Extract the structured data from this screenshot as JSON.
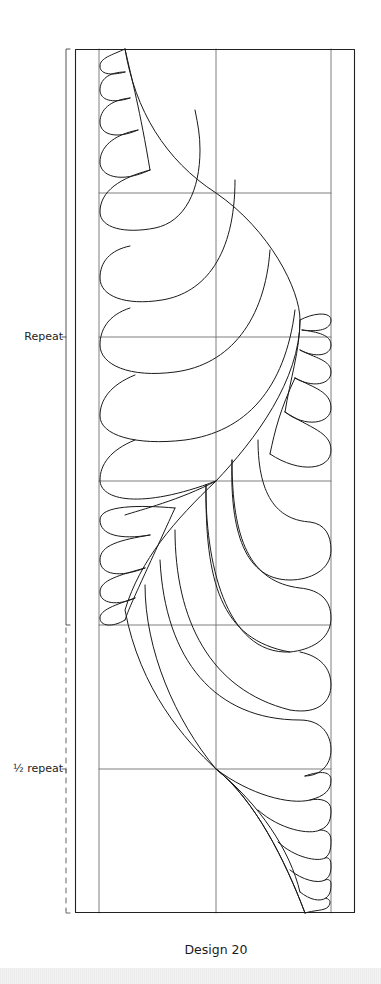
{
  "figure": {
    "caption": "Design 20",
    "labels": {
      "repeat": "Repeat",
      "half_repeat": "½ repeat"
    },
    "colors": {
      "stroke": "#1a1a1a",
      "grid": "#6e6e6e",
      "background": "#ffffff",
      "footer_band": "#efefef"
    }
  }
}
